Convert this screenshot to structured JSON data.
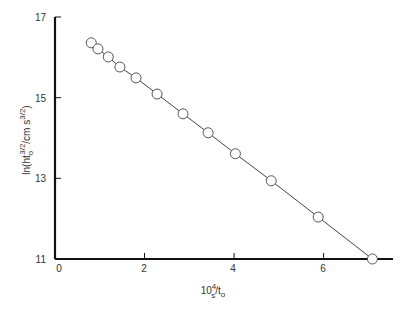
{
  "chart_data": {
    "type": "line",
    "title": "",
    "xlabel": "10^4 s/t_o",
    "ylabel": "ln(ht_o^{3/2}/cm s^{3/2})",
    "xlim": [
      0,
      7.55
    ],
    "ylim": [
      11,
      17
    ],
    "x_ticks": [
      0,
      2,
      4,
      6
    ],
    "y_ticks": [
      11,
      13,
      15,
      17
    ],
    "grid": false,
    "legend": null,
    "series": [
      {
        "name": "data",
        "marker": "open-circle",
        "line": "straight-fit",
        "x": [
          0.81,
          0.96,
          1.19,
          1.45,
          1.81,
          2.28,
          2.86,
          3.42,
          4.03,
          4.83,
          5.88,
          7.09
        ],
        "y": [
          16.36,
          16.21,
          16.01,
          15.76,
          15.49,
          15.09,
          14.6,
          14.13,
          13.61,
          12.94,
          12.04,
          11.0
        ]
      }
    ]
  },
  "labels": {
    "x_axis": {
      "base": "10",
      "sup": "4",
      "sub": "s",
      "rest": "/t",
      "rest_sub": "o"
    },
    "y_axis": "ln(ht",
    "y_axis_sub": "o",
    "y_axis_sup1": "3/2",
    "y_axis_mid": "/cm s",
    "y_axis_sup2": "3/2",
    "y_axis_end": ")"
  },
  "ticks": {
    "x": [
      "0",
      "2",
      "4",
      "6"
    ],
    "y": [
      "17",
      "15",
      "13",
      "11"
    ]
  }
}
